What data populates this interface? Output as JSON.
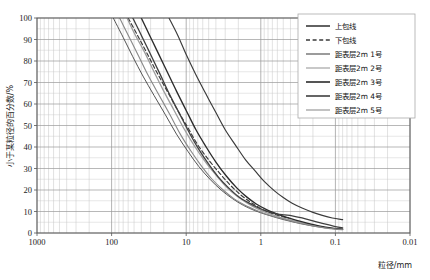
{
  "chart_data": {
    "type": "line",
    "title": "",
    "xlabel": "粒径/mm",
    "ylabel": "小于某粒径的百分数/%",
    "x_scale": "log",
    "x_reversed": true,
    "xlim": [
      1000,
      0.01
    ],
    "ylim": [
      0,
      100
    ],
    "grid": true,
    "legend_position": "top-right",
    "xticks": [
      "1000",
      "100",
      "10",
      "1",
      "0.1",
      "0.01"
    ],
    "xtick_values": [
      1000,
      100,
      10,
      1,
      0.1,
      0.01
    ],
    "yticks": [
      "0",
      "10",
      "20",
      "30",
      "40",
      "50",
      "60",
      "70",
      "80",
      "90",
      "100"
    ],
    "ytick_values": [
      0,
      10,
      20,
      30,
      40,
      50,
      60,
      70,
      80,
      90,
      100
    ],
    "series": [
      {
        "name": "上包线",
        "style": "solid",
        "color": "#3a3a3a",
        "width": 1.15,
        "points": [
          [
            17.0,
            100
          ],
          [
            13.0,
            92
          ],
          [
            10.0,
            83
          ],
          [
            7.5,
            74
          ],
          [
            5.5,
            65
          ],
          [
            4.0,
            56
          ],
          [
            3.0,
            48
          ],
          [
            2.2,
            41
          ],
          [
            1.6,
            34
          ],
          [
            1.2,
            29
          ],
          [
            0.9,
            24
          ],
          [
            0.65,
            19.5
          ],
          [
            0.5,
            16.5
          ],
          [
            0.38,
            13.8
          ],
          [
            0.28,
            11.6
          ],
          [
            0.2,
            9.6
          ],
          [
            0.15,
            8.2
          ],
          [
            0.11,
            7.0
          ],
          [
            0.08,
            6.2
          ]
        ]
      },
      {
        "name": "下包线",
        "style": "dashed",
        "color": "#3a3a3a",
        "width": 1.15,
        "points": [
          [
            60.0,
            100
          ],
          [
            45.0,
            92
          ],
          [
            34.0,
            84
          ],
          [
            25.0,
            75
          ],
          [
            18.0,
            66
          ],
          [
            13.0,
            57
          ],
          [
            9.5,
            49
          ],
          [
            7.0,
            41
          ],
          [
            5.0,
            34
          ],
          [
            3.6,
            28
          ],
          [
            2.6,
            22.5
          ],
          [
            1.9,
            18
          ],
          [
            1.4,
            14.5
          ],
          [
            1.05,
            11.8
          ],
          [
            0.8,
            9.8
          ],
          [
            0.62,
            8.4
          ],
          [
            0.5,
            7.5
          ],
          [
            0.42,
            7.0
          ]
        ]
      },
      {
        "name": "距表层2m 1号",
        "style": "solid",
        "color": "#4a4a4a",
        "width": 0.95,
        "points": [
          [
            95.0,
            100
          ],
          [
            70.0,
            91
          ],
          [
            52.0,
            82
          ],
          [
            38.0,
            73
          ],
          [
            27.0,
            64
          ],
          [
            19.0,
            55
          ],
          [
            13.5,
            46
          ],
          [
            9.5,
            38
          ],
          [
            6.8,
            31
          ],
          [
            4.8,
            25
          ],
          [
            3.4,
            20
          ],
          [
            2.4,
            16
          ],
          [
            1.7,
            12.8
          ],
          [
            1.2,
            10.4
          ],
          [
            0.85,
            8.6
          ],
          [
            0.6,
            7.0
          ],
          [
            0.42,
            5.6
          ],
          [
            0.28,
            4.2
          ],
          [
            0.18,
            3.0
          ],
          [
            0.12,
            2.2
          ],
          [
            0.08,
            1.6
          ]
        ]
      },
      {
        "name": "距表层2m 2号",
        "style": "solid",
        "color": "#9d9d9d",
        "width": 1.3,
        "points": [
          [
            62.0,
            100
          ],
          [
            48.0,
            92
          ],
          [
            36.0,
            84
          ],
          [
            27.0,
            75
          ],
          [
            20.0,
            66
          ],
          [
            14.5,
            57
          ],
          [
            10.5,
            48
          ],
          [
            7.6,
            40
          ],
          [
            5.5,
            33
          ],
          [
            4.0,
            27
          ],
          [
            2.9,
            21.5
          ],
          [
            2.1,
            17.2
          ],
          [
            1.5,
            13.8
          ],
          [
            1.1,
            11.2
          ],
          [
            0.8,
            9.2
          ],
          [
            0.58,
            7.5
          ],
          [
            0.42,
            6.2
          ],
          [
            0.3,
            5.0
          ],
          [
            0.2,
            3.6
          ],
          [
            0.13,
            2.4
          ],
          [
            0.08,
            1.7
          ]
        ]
      },
      {
        "name": "距表层2m 3号",
        "style": "solid",
        "color": "#2b2b2b",
        "width": 1.35,
        "points": [
          [
            40.0,
            100
          ],
          [
            31.0,
            92
          ],
          [
            24.0,
            84
          ],
          [
            18.0,
            75
          ],
          [
            13.5,
            66
          ],
          [
            10.0,
            57
          ],
          [
            7.4,
            48
          ],
          [
            5.4,
            40
          ],
          [
            4.0,
            33
          ],
          [
            2.9,
            26.5
          ],
          [
            2.1,
            21
          ],
          [
            1.55,
            16.8
          ],
          [
            1.15,
            13.5
          ],
          [
            0.85,
            11.0
          ],
          [
            0.62,
            9.0
          ],
          [
            0.46,
            7.4
          ],
          [
            0.34,
            6.0
          ],
          [
            0.24,
            4.6
          ],
          [
            0.16,
            3.2
          ],
          [
            0.11,
            2.3
          ],
          [
            0.08,
            1.8
          ]
        ]
      },
      {
        "name": "距表层2m 4号",
        "style": "solid",
        "color": "#3f3f3f",
        "width": 1.3,
        "points": [
          [
            52.0,
            100
          ],
          [
            40.0,
            92
          ],
          [
            30.0,
            83
          ],
          [
            22.5,
            74
          ],
          [
            17.0,
            65
          ],
          [
            12.5,
            56
          ],
          [
            9.2,
            47
          ],
          [
            6.8,
            39
          ],
          [
            5.0,
            32
          ],
          [
            3.7,
            26
          ],
          [
            2.7,
            21
          ],
          [
            2.0,
            17
          ],
          [
            1.45,
            14.0
          ],
          [
            1.05,
            11.5
          ],
          [
            0.78,
            9.8
          ],
          [
            0.6,
            8.8
          ],
          [
            0.48,
            8.4
          ],
          [
            0.38,
            8.0
          ],
          [
            0.28,
            7.0
          ],
          [
            0.2,
            5.6
          ],
          [
            0.14,
            4.2
          ],
          [
            0.1,
            3.0
          ],
          [
            0.08,
            2.4
          ]
        ]
      },
      {
        "name": "距表层2m 5号",
        "style": "solid",
        "color": "#888888",
        "width": 1.1,
        "points": [
          [
            78.0,
            100
          ],
          [
            58.0,
            91
          ],
          [
            43.0,
            82
          ],
          [
            32.0,
            73
          ],
          [
            23.0,
            64
          ],
          [
            16.5,
            55
          ],
          [
            12.0,
            46
          ],
          [
            8.6,
            38
          ],
          [
            6.2,
            31
          ],
          [
            4.5,
            25
          ],
          [
            3.2,
            20
          ],
          [
            2.3,
            16
          ],
          [
            1.65,
            13.0
          ],
          [
            1.2,
            10.8
          ],
          [
            0.88,
            9.0
          ],
          [
            0.65,
            7.6
          ],
          [
            0.48,
            6.4
          ],
          [
            0.34,
            5.0
          ],
          [
            0.22,
            3.6
          ],
          [
            0.14,
            2.4
          ],
          [
            0.08,
            1.5
          ]
        ]
      }
    ]
  },
  "legend": {
    "items": [
      {
        "label": "上包线",
        "style": "solid",
        "color": "#3a3a3a",
        "width": 1.6
      },
      {
        "label": "下包线",
        "style": "dashed",
        "color": "#3a3a3a",
        "width": 1.6
      },
      {
        "label": "距表层2m 1号",
        "style": "solid",
        "color": "#4a4a4a",
        "width": 1.1
      },
      {
        "label": "距表层2m 2号",
        "style": "solid",
        "color": "#b0b0b0",
        "width": 1.4
      },
      {
        "label": "距表层2m 3号",
        "style": "solid",
        "color": "#2b2b2b",
        "width": 1.6
      },
      {
        "label": "距表层2m 4号",
        "style": "solid",
        "color": "#3f3f3f",
        "width": 1.6
      },
      {
        "label": "距表层2m 5号",
        "style": "solid",
        "color": "#909090",
        "width": 1.1
      }
    ]
  },
  "colors": {
    "background": "#ffffff",
    "grid_major": "#9a9a9a",
    "grid_minor": "#c9c9c9",
    "axis": "#555555",
    "text": "#1a1a1a",
    "legend_border": "#aaaaaa"
  }
}
